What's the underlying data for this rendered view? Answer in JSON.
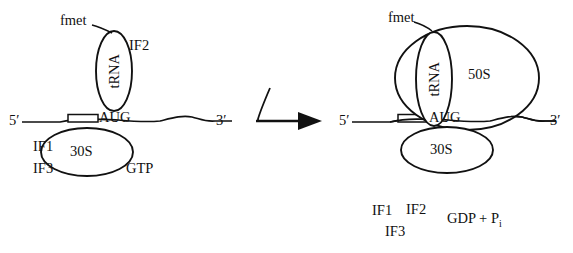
{
  "figure": {
    "type": "biology-diagram",
    "background_color": "#ffffff",
    "stroke_color": "#111111"
  },
  "left_panel": {
    "fmet_label": "fmet",
    "trna_label": "tRNA",
    "if2_label": "IF2",
    "five_prime": "5′",
    "aug_label": "AUG",
    "three_prime": "3′",
    "if1_label": "IF1",
    "if3_label": "IF3",
    "small_subunit_label": "30S",
    "gtp_label": "GTP"
  },
  "arrow": {
    "name": "reaction-arrow",
    "direction": "left-to-right",
    "has_curved_input_tail": true
  },
  "right_panel": {
    "fmet_label": "fmet",
    "trna_label": "tRNA",
    "large_subunit_label": "50S",
    "five_prime": "5′",
    "aug_label": "AUG",
    "three_prime": "3′",
    "small_subunit_label": "30S",
    "released": {
      "if1_label": "IF1",
      "if2_label": "IF2",
      "if3_label": "IF3",
      "gdp_label": "GDP + P",
      "gdp_subscript": "i"
    }
  }
}
